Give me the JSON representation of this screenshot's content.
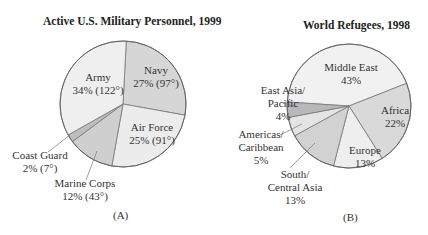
{
  "chart_data": [
    {
      "type": "pie",
      "title": "Active U.S. Military Personnel, 1999",
      "caption": "(A)",
      "categories": [
        "Navy",
        "Air Force",
        "Marine Corps",
        "Coast Guard",
        "Army"
      ],
      "values": [
        27,
        25,
        12,
        2,
        34
      ],
      "degrees": [
        97,
        91,
        43,
        7,
        122
      ],
      "labels": [
        {
          "name": "Navy",
          "value": "27% (97°)"
        },
        {
          "name": "Air Force",
          "value": "25% (91°)"
        },
        {
          "name": "Marine Corps",
          "value": "12% (43°)"
        },
        {
          "name": "Coast Guard",
          "value": "2% (7°)"
        },
        {
          "name": "Army",
          "value": "34% (122°)"
        }
      ],
      "colors": [
        "#d6d6d6",
        "#ececec",
        "#cfcfcf",
        "#bdbdbd",
        "#efefef"
      ]
    },
    {
      "type": "pie",
      "title": "World Refugees, 1998",
      "caption": "(B)",
      "categories": [
        "Middle East",
        "Africa",
        "Europe",
        "South/Central Asia",
        "Americas/Caribbean",
        "East Asia/Pacific"
      ],
      "values": [
        43,
        22,
        13,
        13,
        5,
        4
      ],
      "labels": [
        {
          "name": "Middle East",
          "value": "43%"
        },
        {
          "name": "Africa",
          "value": "22%"
        },
        {
          "name": "Europe",
          "value": "13%"
        },
        {
          "name": "South/ Central Asia",
          "value": "13%"
        },
        {
          "name": "Americas/ Caribbean",
          "value": "5%"
        },
        {
          "name": "East Asia/ Pacific",
          "value": "4%"
        }
      ],
      "colors": [
        "#f1f1f1",
        "#d9d9d9",
        "#eeeeee",
        "#d2d2d2",
        "#e4e4e4",
        "#b8b8b8"
      ]
    }
  ],
  "a": {
    "title": "Active U.S. Military Personnel, 1999",
    "caption": "(A)",
    "army": {
      "name": "Army",
      "value": "34% (122°)"
    },
    "navy": {
      "name": "Navy",
      "value": "27% (97°)"
    },
    "airforce": {
      "name": "Air Force",
      "value": "25% (91°)"
    },
    "coastguard": {
      "name": "Coast Guard",
      "value": "2% (7°)"
    },
    "marine": {
      "name": "Marine Corps",
      "value": "12% (43°)"
    }
  },
  "b": {
    "title": "World Refugees, 1998",
    "caption": "(B)",
    "mideast": {
      "name": "Middle East",
      "value": "43%"
    },
    "africa": {
      "name": "Africa",
      "value": "22%"
    },
    "europe": {
      "name": "Europe",
      "value": "13%"
    },
    "southasia": {
      "name1": "South/",
      "name2": "Central Asia",
      "value": "13%"
    },
    "americas": {
      "name1": "Americas/",
      "name2": "Caribbean",
      "value": "5%"
    },
    "eastasia": {
      "name1": "East Asia/",
      "name2": "Pacific",
      "value": "4%"
    }
  }
}
